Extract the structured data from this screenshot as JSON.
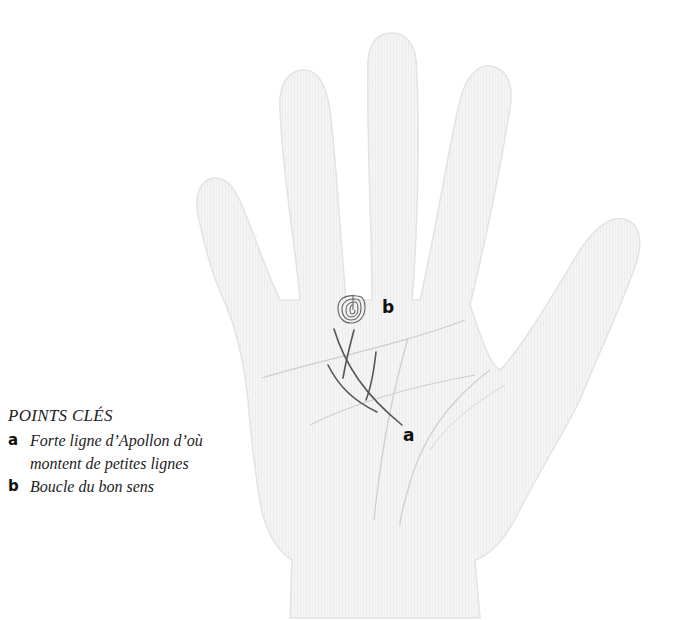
{
  "diagram": {
    "hand_fill_color": "#f1f1f1",
    "hand_outline_color": "#e2e2e2",
    "palm_line_color": "#c9c9c9",
    "highlight_line_color": "#555555",
    "markers": [
      {
        "key": "a",
        "label": "a"
      },
      {
        "key": "b",
        "label": "b"
      }
    ]
  },
  "legend": {
    "title": "POINTS CLÉS",
    "items": [
      {
        "key": "a",
        "text": "Forte ligne d’Apollon d’où montent de petites lignes"
      },
      {
        "key": "b",
        "text": "Boucle du bon sens"
      }
    ]
  }
}
